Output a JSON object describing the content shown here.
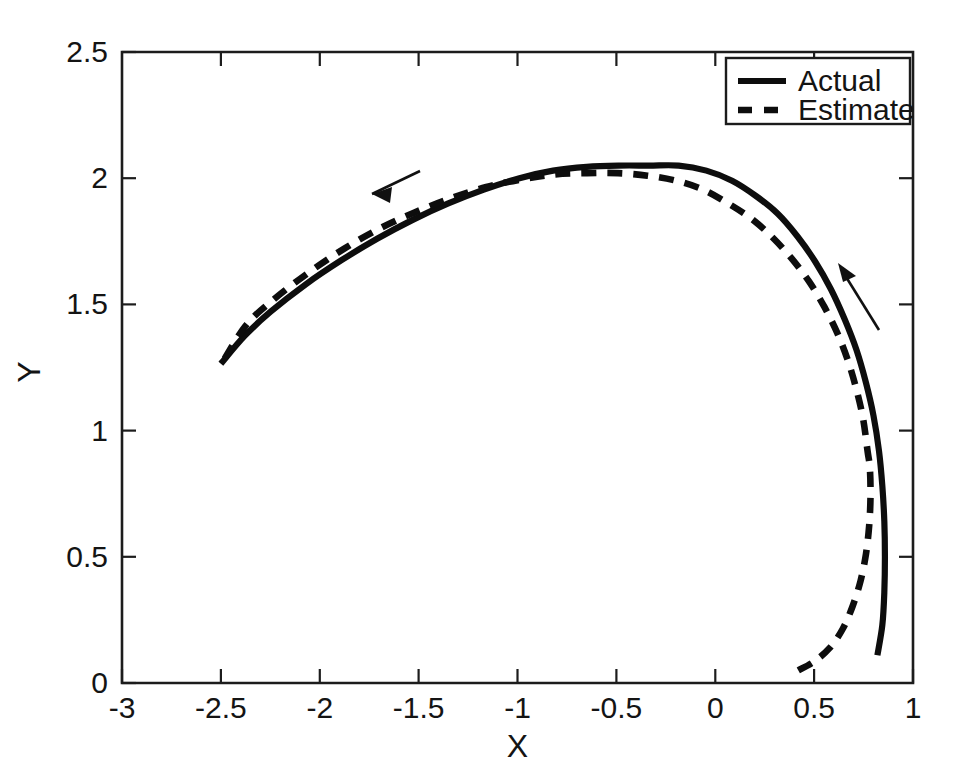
{
  "chart_data": {
    "type": "line",
    "title": "",
    "subtitle": "",
    "xlabel": "X",
    "ylabel": "Y",
    "xlim": [
      -3,
      1
    ],
    "ylim": [
      0,
      2.5
    ],
    "grid": false,
    "legend_position": "top-right",
    "xticks": [
      -3,
      -2.5,
      -2,
      -1.5,
      -1,
      -0.5,
      0,
      0.5,
      1
    ],
    "xticklabels": [
      "-3",
      "-2.5",
      "-2",
      "-1.5",
      "-1",
      "-0.5",
      "0",
      "0.5",
      "1"
    ],
    "yticks": [
      0,
      0.5,
      1,
      1.5,
      2,
      2.5
    ],
    "yticklabels": [
      "0",
      "0.5",
      "1",
      "1.5",
      "2",
      "2.5"
    ],
    "series": [
      {
        "name": "Actual",
        "style": "solid",
        "color": "#0d0d0d",
        "x": [
          0.82,
          0.845,
          0.855,
          0.858,
          0.855,
          0.845,
          0.828,
          0.8,
          0.762,
          0.714,
          0.655,
          0.585,
          0.505,
          0.415,
          0.315,
          0.205,
          0.085,
          -0.045,
          -0.185,
          -0.335,
          -0.49,
          -0.65,
          -0.82,
          -0.99,
          -1.17,
          -1.35,
          -1.53,
          -1.71,
          -1.89,
          -2.07,
          -2.25,
          -2.38,
          -2.5
        ],
        "y": [
          0.11,
          0.23,
          0.36,
          0.5,
          0.64,
          0.78,
          0.92,
          1.06,
          1.19,
          1.32,
          1.44,
          1.56,
          1.67,
          1.77,
          1.86,
          1.93,
          1.99,
          2.03,
          2.05,
          2.05,
          2.05,
          2.045,
          2.03,
          2.0,
          1.955,
          1.9,
          1.835,
          1.76,
          1.675,
          1.58,
          1.47,
          1.375,
          1.265
        ]
      },
      {
        "name": "Estimate",
        "style": "dashed",
        "color": "#0d0d0d",
        "x": [
          0.42,
          0.5,
          0.58,
          0.645,
          0.695,
          0.735,
          0.762,
          0.778,
          0.785,
          0.782,
          0.77,
          0.748,
          0.715,
          0.672,
          0.618,
          0.552,
          0.475,
          0.388,
          0.29,
          0.182,
          0.065,
          -0.062,
          -0.198,
          -0.342,
          -0.492,
          -0.648,
          -0.812,
          -0.982,
          -1.158,
          -1.338,
          -1.518,
          -1.698,
          -1.878,
          -2.058,
          -2.24,
          -2.375,
          -2.5
        ],
        "y": [
          0.05,
          0.085,
          0.14,
          0.215,
          0.305,
          0.405,
          0.51,
          0.62,
          0.735,
          0.85,
          0.92,
          1.045,
          1.16,
          1.275,
          1.385,
          1.49,
          1.59,
          1.68,
          1.765,
          1.84,
          1.9,
          1.955,
          1.99,
          2.01,
          2.02,
          2.02,
          2.015,
          1.995,
          1.965,
          1.92,
          1.865,
          1.8,
          1.72,
          1.625,
          1.515,
          1.415,
          1.26
        ]
      }
    ],
    "annotations": [
      {
        "name": "direction-arrow-left",
        "type": "arrow",
        "from": [
          -0.985,
          2.225
        ],
        "to": [
          -1.58,
          2.115
        ],
        "description": "arrow pointing left along upper trajectory"
      },
      {
        "name": "direction-arrow-right",
        "type": "arrow",
        "from": [
          0.645,
          1.4
        ],
        "to": [
          0.435,
          1.665
        ],
        "description": "arrow pointing up-left along right trajectory"
      }
    ]
  },
  "legend": {
    "items": [
      {
        "label": "Actual",
        "style": "solid"
      },
      {
        "label": "Estimate",
        "style": "dashed"
      }
    ]
  },
  "axes": {
    "x_label": "X",
    "y_label": "Y"
  }
}
